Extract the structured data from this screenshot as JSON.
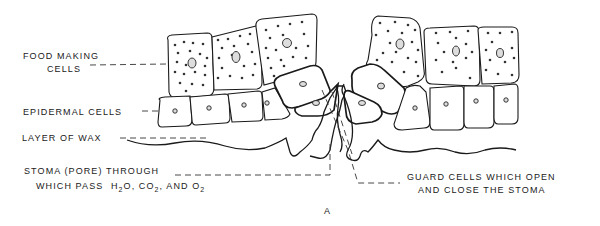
{
  "diagram": {
    "figure_label": "A",
    "labels": {
      "food_making_1": "FOOD MAKING",
      "food_making_2": "CELLS",
      "epidermal": "EPIDERMAL CELLS",
      "wax": "LAYER OF WAX",
      "stoma_1": "STOMA (PORE) THROUGH",
      "stoma_2_prefix": "WHICH PASS",
      "stoma_h": "H",
      "stoma_h_sub": "2",
      "stoma_o": "O, CO",
      "stoma_co_sub": "2",
      "stoma_and": ", AND O",
      "stoma_o_sub": "2",
      "guard_1": "GUARD CELLS WHICH OPEN",
      "guard_2": "AND CLOSE THE STOMA"
    },
    "colors": {
      "ink": "#1a1a1a",
      "background": "#ffffff"
    }
  }
}
